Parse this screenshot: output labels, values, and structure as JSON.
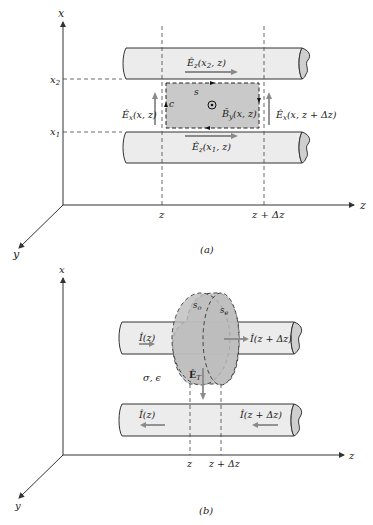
{
  "figure_a": {
    "caption": "(a)",
    "axes": {
      "x": "x",
      "y": "y",
      "z": "z"
    },
    "ticks": {
      "x2": "x",
      "x2_sub": "2",
      "x1": "x",
      "x1_sub": "1",
      "z": "z",
      "z_dz": "z + Δz"
    },
    "labels": {
      "ez_top": "Ê",
      "ez_top_sub": "z",
      "ez_top_args": "(x",
      "ez_top_args_sub": "2",
      "ez_top_args_end": ", z)",
      "ez_bot": "Ê",
      "ez_bot_sub": "z",
      "ez_bot_args": "(x",
      "ez_bot_args_sub": "1",
      "ez_bot_args_end": ", z)",
      "ex_left": "Ê",
      "ex_left_sub": "x",
      "ex_left_args": "(x, z)",
      "ex_right": "Ê",
      "ex_right_sub": "x",
      "ex_right_args": "(x, z + Δz)",
      "by": "B̂",
      "by_sub": "y",
      "by_args": "(x, z)",
      "surface": "s",
      "contour": "c"
    }
  },
  "figure_b": {
    "caption": "(b)",
    "axes": {
      "x": "x",
      "y": "y",
      "z": "z"
    },
    "ticks": {
      "z": "z",
      "z_dz": "z + Δz"
    },
    "labels": {
      "i_top_left": "Î(z)",
      "i_top_right": "Î(z + Δz)",
      "i_bot_left": "Î(z)",
      "i_bot_right": "Î(z + Δz)",
      "so": "s",
      "so_sub": "o",
      "se": "s",
      "se_sub": "e",
      "et": "Ê",
      "et_sub": "T",
      "medium": "σ, ϵ"
    }
  },
  "colors": {
    "conductor_fill": "#ececec",
    "surface_fill": "#c9c9c9",
    "field_arrow": "#8a8a8a",
    "line": "#333333"
  }
}
